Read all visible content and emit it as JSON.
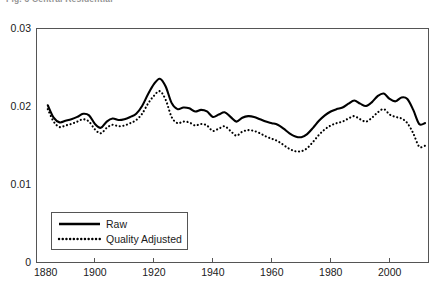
{
  "caption": {
    "clipped_text": "Fig. 3  Central Residential"
  },
  "chart_data": {
    "type": "line",
    "title": "",
    "subtitle": "",
    "xlabel": "",
    "ylabel": "",
    "xlim": [
      1880,
      2013
    ],
    "ylim": [
      0,
      0.03
    ],
    "xticks": [
      1880,
      1900,
      1920,
      1940,
      1960,
      1980,
      2000
    ],
    "xtick_labels": [
      "1880",
      "1900",
      "1920",
      "1940",
      "1960",
      "1980",
      "2000"
    ],
    "yticks": [
      0,
      0.01,
      0.02,
      0.03
    ],
    "ytick_labels": [
      "0",
      "0.01",
      "0.02",
      "0.03"
    ],
    "grid": false,
    "legend_position": "bottom-left",
    "legend_entries": [
      "Raw",
      "Quality Adjusted"
    ],
    "series": [
      {
        "name": "Raw",
        "style": "solid",
        "color": "#000000",
        "x": [
          1884,
          1886,
          1888,
          1890,
          1892,
          1894,
          1896,
          1898,
          1900,
          1902,
          1904,
          1906,
          1908,
          1910,
          1912,
          1914,
          1916,
          1918,
          1920,
          1922,
          1924,
          1926,
          1928,
          1930,
          1932,
          1934,
          1936,
          1938,
          1940,
          1942,
          1944,
          1946,
          1948,
          1950,
          1952,
          1954,
          1956,
          1958,
          1960,
          1962,
          1964,
          1966,
          1968,
          1970,
          1972,
          1974,
          1976,
          1978,
          1980,
          1982,
          1984,
          1986,
          1988,
          1990,
          1992,
          1994,
          1996,
          1998,
          2000,
          2002,
          2004,
          2006,
          2008,
          2010,
          2012
        ],
        "values": [
          0.0201,
          0.0185,
          0.0179,
          0.0181,
          0.0183,
          0.0186,
          0.019,
          0.0188,
          0.0177,
          0.0172,
          0.018,
          0.0184,
          0.0182,
          0.0183,
          0.0186,
          0.019,
          0.02,
          0.0215,
          0.0228,
          0.0235,
          0.0225,
          0.0204,
          0.0196,
          0.0198,
          0.0197,
          0.0193,
          0.0195,
          0.0193,
          0.0186,
          0.0189,
          0.0192,
          0.0186,
          0.018,
          0.0185,
          0.0187,
          0.0186,
          0.0183,
          0.018,
          0.0178,
          0.0176,
          0.0171,
          0.0165,
          0.0161,
          0.016,
          0.0164,
          0.0172,
          0.0181,
          0.0188,
          0.0193,
          0.0196,
          0.0198,
          0.0203,
          0.0207,
          0.0203,
          0.02,
          0.0205,
          0.0213,
          0.0216,
          0.0209,
          0.0206,
          0.0211,
          0.0209,
          0.0195,
          0.0177,
          0.0178
        ]
      },
      {
        "name": "Quality Adjusted",
        "style": "dotted",
        "color": "#000000",
        "x": [
          1884,
          1886,
          1888,
          1890,
          1892,
          1894,
          1896,
          1898,
          1900,
          1902,
          1904,
          1906,
          1908,
          1910,
          1912,
          1914,
          1916,
          1918,
          1920,
          1922,
          1924,
          1926,
          1928,
          1930,
          1932,
          1934,
          1936,
          1938,
          1940,
          1942,
          1944,
          1946,
          1948,
          1950,
          1952,
          1954,
          1956,
          1958,
          1960,
          1962,
          1964,
          1966,
          1968,
          1970,
          1972,
          1974,
          1976,
          1978,
          1980,
          1982,
          1984,
          1986,
          1988,
          1990,
          1992,
          1994,
          1996,
          1998,
          2000,
          2002,
          2004,
          2006,
          2008,
          2010,
          2012
        ],
        "values": [
          0.0196,
          0.018,
          0.0173,
          0.0175,
          0.0177,
          0.018,
          0.0183,
          0.018,
          0.017,
          0.0165,
          0.0172,
          0.0176,
          0.0174,
          0.0175,
          0.0178,
          0.0182,
          0.019,
          0.0203,
          0.0213,
          0.0219,
          0.0208,
          0.0186,
          0.0178,
          0.018,
          0.0179,
          0.0175,
          0.0177,
          0.0175,
          0.0168,
          0.0171,
          0.0174,
          0.0168,
          0.0162,
          0.0167,
          0.0169,
          0.0168,
          0.0165,
          0.0161,
          0.0158,
          0.0155,
          0.015,
          0.0145,
          0.0142,
          0.0142,
          0.0146,
          0.0154,
          0.0163,
          0.017,
          0.0175,
          0.0178,
          0.018,
          0.0184,
          0.0187,
          0.0183,
          0.018,
          0.0185,
          0.0192,
          0.0196,
          0.0189,
          0.0186,
          0.0184,
          0.0178,
          0.0165,
          0.0148,
          0.0149
        ]
      }
    ]
  }
}
